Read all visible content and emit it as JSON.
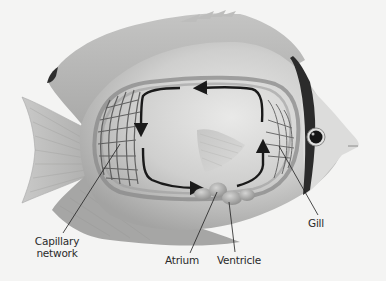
{
  "diagram": {
    "labels": {
      "capillary_network": "Capillary\nnetwork",
      "capillary_line1": "Capillary",
      "capillary_line2": "network",
      "atrium": "Atrium",
      "ventricle": "Ventricle",
      "gill": "Gill"
    },
    "flow_direction": "clockwise-from-heart: ventricle → gill capillaries → body capillary network → atrium",
    "colors": {
      "background": "#f4f4f3",
      "body_light": "#d9d9d8",
      "body_mid": "#b8b8b7",
      "body_dark": "#8e8e8d",
      "stripe": "#2b2b2b",
      "vessel": "#8a8a89",
      "arrow": "#1a1a1a",
      "label_text": "#2a2a2a"
    }
  }
}
